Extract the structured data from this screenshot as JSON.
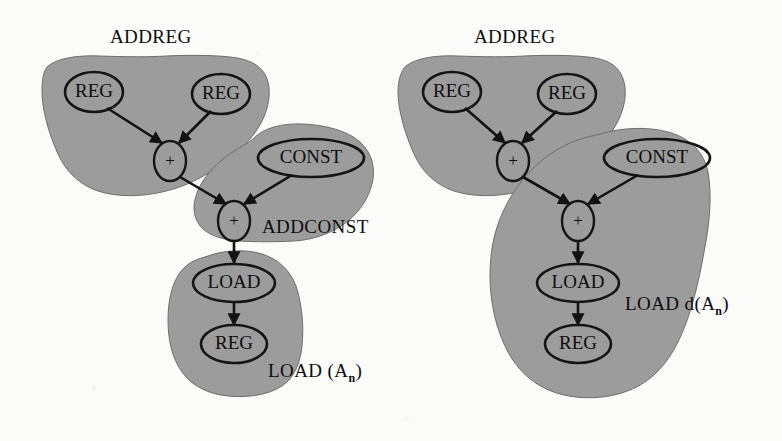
{
  "figure": {
    "background_color": "#fbfbfa",
    "blob_fill_color": "#9c9c9c",
    "blob_stroke_color": "#6e6e6e",
    "node_stroke_color": "#141414",
    "edge_color": "#121212"
  },
  "diagrams": [
    {
      "id": "left",
      "name": "load-an-tiling",
      "region_labels": [
        {
          "name": "addreg",
          "text": "ADDREG",
          "x": 110,
          "y": 43
        },
        {
          "name": "addconst",
          "text": "ADDCONST",
          "x": 262,
          "y": 233
        },
        {
          "name": "load-an",
          "text": "LOAD (A",
          "sub": "n",
          "tail": ")",
          "x": 268,
          "y": 377
        }
      ],
      "nodes": [
        {
          "name": "reg-left",
          "label": "REG",
          "cx": 94,
          "cy": 92,
          "rx": 29,
          "ry": 20
        },
        {
          "name": "reg-right",
          "label": "REG",
          "cx": 221,
          "cy": 94,
          "rx": 29,
          "ry": 20
        },
        {
          "name": "plus-top",
          "label": "+",
          "cx": 170,
          "cy": 161,
          "rx": 16,
          "ry": 20
        },
        {
          "name": "const",
          "label": "CONST",
          "cx": 311,
          "cy": 158,
          "rx": 53,
          "ry": 19
        },
        {
          "name": "plus-bottom",
          "label": "+",
          "cx": 234,
          "cy": 221,
          "rx": 16,
          "ry": 20
        },
        {
          "name": "load",
          "label": "LOAD",
          "cx": 234,
          "cy": 283,
          "rx": 41,
          "ry": 19
        },
        {
          "name": "reg-result",
          "label": "REG",
          "cx": 234,
          "cy": 344,
          "rx": 33,
          "ry": 19
        }
      ],
      "edges": [
        {
          "from": "reg-left",
          "to": "plus-top"
        },
        {
          "from": "reg-right",
          "to": "plus-top"
        },
        {
          "from": "plus-top",
          "to": "plus-bottom"
        },
        {
          "from": "const",
          "to": "plus-bottom"
        },
        {
          "from": "plus-bottom",
          "to": "load"
        },
        {
          "from": "load",
          "to": "reg-result"
        }
      ]
    },
    {
      "id": "right",
      "name": "load-d-an-tiling",
      "region_labels": [
        {
          "name": "addreg",
          "text": "ADDREG",
          "x": 474,
          "y": 43
        },
        {
          "name": "load-d-an",
          "text": "LOAD d(A",
          "sub": "n",
          "tail": ")",
          "x": 625,
          "y": 310
        }
      ],
      "nodes": [
        {
          "name": "reg-left",
          "label": "REG",
          "cx": 452,
          "cy": 92,
          "rx": 29,
          "ry": 20
        },
        {
          "name": "reg-right",
          "label": "REG",
          "cx": 567,
          "cy": 94,
          "rx": 29,
          "ry": 20
        },
        {
          "name": "plus-top",
          "label": "+",
          "cx": 513,
          "cy": 161,
          "rx": 16,
          "ry": 20
        },
        {
          "name": "const",
          "label": "CONST",
          "cx": 657,
          "cy": 158,
          "rx": 53,
          "ry": 19
        },
        {
          "name": "plus-bottom",
          "label": "+",
          "cx": 578,
          "cy": 221,
          "rx": 16,
          "ry": 20
        },
        {
          "name": "load",
          "label": "LOAD",
          "cx": 578,
          "cy": 283,
          "rx": 41,
          "ry": 19
        },
        {
          "name": "reg-result",
          "label": "REG",
          "cx": 578,
          "cy": 344,
          "rx": 33,
          "ry": 19
        }
      ],
      "edges": [
        {
          "from": "reg-left",
          "to": "plus-top"
        },
        {
          "from": "reg-right",
          "to": "plus-top"
        },
        {
          "from": "plus-top",
          "to": "plus-bottom"
        },
        {
          "from": "const",
          "to": "plus-bottom"
        },
        {
          "from": "plus-bottom",
          "to": "load"
        },
        {
          "from": "load",
          "to": "reg-result"
        }
      ]
    }
  ]
}
